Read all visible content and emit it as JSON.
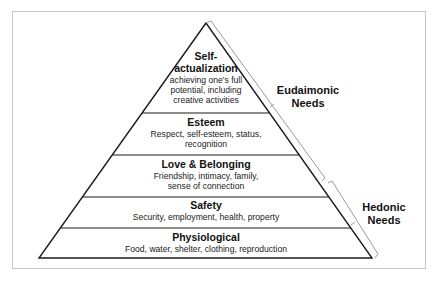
{
  "diagram": {
    "type": "pyramid",
    "levels": [
      {
        "title_line1": "Self-",
        "title_line2": "actualization",
        "desc_line1": "achieving one's full",
        "desc_line2": "potential, including",
        "desc_line3": "creative activities"
      },
      {
        "title": "Esteem",
        "desc_line1": "Respect, self-esteem, status,",
        "desc_line2": "recognition"
      },
      {
        "title": "Love & Belonging",
        "desc_line1": "Friendship, intimacy, family,",
        "desc_line2": "sense of connection"
      },
      {
        "title": "Safety",
        "desc_line1": "Security, employment, health, property"
      },
      {
        "title": "Physiological",
        "desc_line1": "Food, water, shelter, clothing, reproduction"
      }
    ],
    "groups": [
      {
        "line1": "Eudaimonic",
        "line2": "Needs",
        "covers": [
          "Self-actualization",
          "Esteem",
          "Love & Belonging (upper)"
        ]
      },
      {
        "line1": "Hedonic",
        "line2": "Needs",
        "covers": [
          "Love & Belonging (lower)",
          "Safety",
          "Physiological"
        ]
      }
    ],
    "colors": {
      "lines": "#1a1a1a",
      "brackets": "#9a9a9a",
      "frame": "#c8c8c8"
    }
  }
}
